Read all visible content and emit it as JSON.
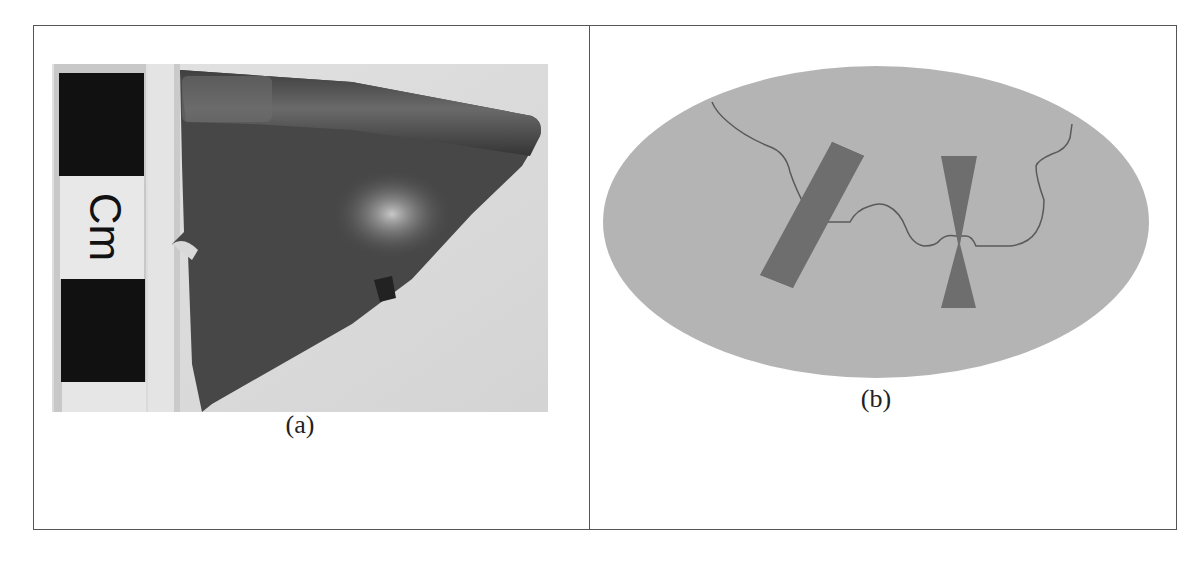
{
  "figure": {
    "panels": [
      {
        "id": "a",
        "caption": "(a)",
        "content": "photograph of dark pottery sherd beside a centimetre scale bar",
        "scale_label": "Cm"
      },
      {
        "id": "b",
        "caption": "(b)",
        "content": "schematic ellipse with irregular crack line and two bowtie-shaped clamps crossing the crack"
      }
    ],
    "colors": {
      "ellipse_fill": "#b4b4b4",
      "clamp_fill": "#6e6e6e",
      "crack_line": "#5a5a5a",
      "sherd_fill": "#4a4a4a",
      "photo_background": "#d9d9d9",
      "scale_black": "#111111",
      "scale_white": "#e8e8e8",
      "border": "#555555"
    }
  }
}
